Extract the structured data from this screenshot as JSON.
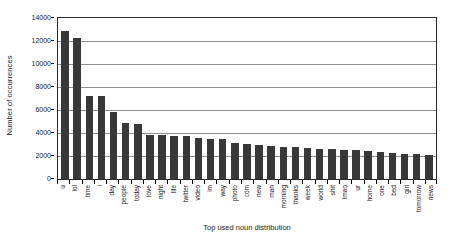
{
  "chart_data": {
    "type": "bar",
    "title": "",
    "xlabel": "Top used noun distribution",
    "ylabel": "Number of occurrences",
    "ylim": [
      0,
      14000
    ],
    "ytick_step": 2000,
    "yticks": [
      0,
      2000,
      4000,
      6000,
      8000,
      10000,
      12000,
      14000
    ],
    "ytick_labels": [
      "0",
      "2000",
      "4000",
      "6000",
      "8000",
      "10000",
      "12000",
      "14000"
    ],
    "grid": true,
    "legend": false,
    "bar_color": "#383838",
    "plot_background": "#ffffff",
    "gridline_color": "#8e8e8e",
    "axis_color": "#2a2a2a",
    "xtick_rotation": 90,
    "categories": [
      "u",
      "lol",
      "time",
      "i",
      "day",
      "people",
      "today",
      "love",
      "night",
      "life",
      "twitter",
      "video",
      "im",
      "way",
      "photo",
      "com",
      "new",
      "man",
      "morning",
      "thanks",
      "week",
      "world",
      "shit",
      "lmao",
      "ur",
      "home",
      "one",
      "bed",
      "girl",
      "tomorrow",
      "news"
    ],
    "values": [
      12900,
      12300,
      7250,
      7250,
      5800,
      4900,
      4750,
      3800,
      3800,
      3750,
      3750,
      3600,
      3500,
      3450,
      3150,
      3050,
      2950,
      2900,
      2800,
      2750,
      2700,
      2650,
      2600,
      2550,
      2500,
      2400,
      2350,
      2300,
      2200,
      2150,
      2100
    ]
  }
}
